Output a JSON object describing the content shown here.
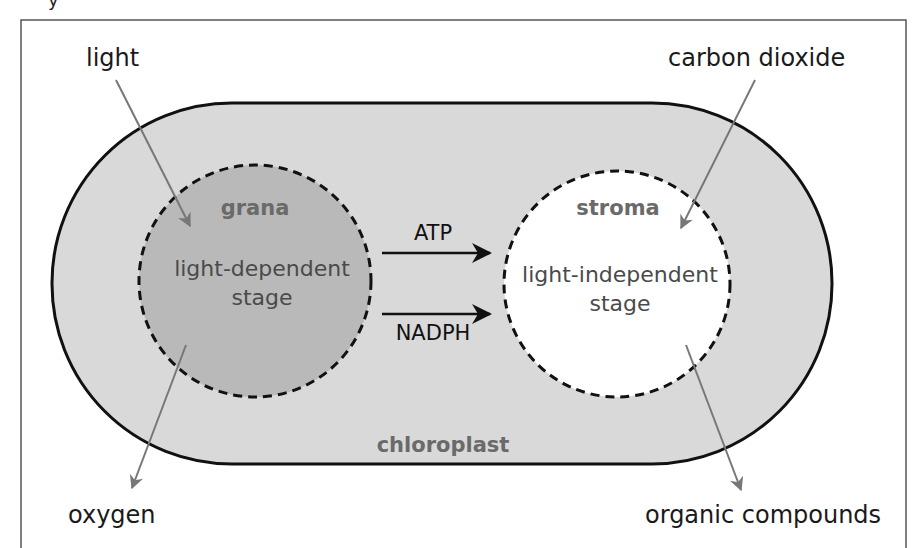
{
  "diagram": {
    "title_fragment": "y",
    "chloroplast": {
      "label": "chloroplast",
      "fill": "#d9d9d9",
      "stroke": "#111111"
    },
    "grana": {
      "label": "grana",
      "stage_line1": "light-dependent",
      "stage_line2": "stage",
      "fill": "#b9b9b9"
    },
    "stroma": {
      "label": "stroma",
      "stage_line1": "light-independent",
      "stage_line2": "stage",
      "fill": "#ffffff"
    },
    "transfer_arrows": [
      {
        "label": "ATP"
      },
      {
        "label": "NADPH"
      }
    ],
    "inputs": [
      {
        "label": "light",
        "target": "grana"
      },
      {
        "label": "carbon dioxide",
        "target": "stroma"
      }
    ],
    "outputs": [
      {
        "label": "oxygen",
        "source": "grana"
      },
      {
        "label": "organic compounds",
        "source": "stroma"
      }
    ],
    "colors": {
      "pointer_arrow": "#777777",
      "frame": "#555555",
      "label_gray": "#6a6a6a"
    }
  }
}
